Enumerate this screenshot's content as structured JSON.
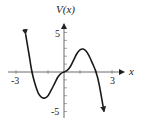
{
  "chart_data": {
    "type": "line",
    "title": "",
    "xlabel": "x",
    "ylabel": "V(x)",
    "xlim": [
      -3.5,
      4.5
    ],
    "ylim": [
      -5.5,
      6
    ],
    "x_ticks": [
      -3,
      -2,
      -1,
      0,
      1,
      2,
      3
    ],
    "x_tick_labels": {
      "-3": "-3",
      "3": "3"
    },
    "y_ticks": [
      -5,
      -4,
      -3,
      -2,
      -1,
      0,
      1,
      2,
      3,
      4,
      5
    ],
    "y_tick_labels": {
      "5": "5",
      "-5": "-5"
    },
    "grid": false,
    "legend": null,
    "series": [
      {
        "name": "V(x)",
        "description": "Polynomial with zeros at x=-2, x=0 (flat inflection), x=2; rises to +inf on left, falls to -inf on right",
        "x": [
          -2.4,
          -2.2,
          -2.0,
          -1.8,
          -1.6,
          -1.4,
          -1.2,
          -1.0,
          -0.8,
          -0.6,
          -0.4,
          -0.2,
          0.0,
          0.2,
          0.4,
          0.6,
          0.8,
          1.0,
          1.2,
          1.4,
          1.6,
          1.8,
          2.0,
          2.2,
          2.5
        ],
        "y": [
          4.8,
          2.4,
          0.0,
          -1.6,
          -2.7,
          -3.2,
          -3.3,
          -3.0,
          -2.3,
          -1.5,
          -0.7,
          -0.2,
          0.0,
          0.2,
          0.7,
          1.5,
          2.3,
          2.8,
          2.9,
          2.6,
          1.9,
          1.0,
          0.0,
          -1.6,
          -5.0
        ]
      }
    ],
    "annotations": [
      "arrow at left end (upward)",
      "arrow at right end (downward)",
      "arrow on positive y-axis",
      "arrow on positive x-axis"
    ]
  },
  "labels": {
    "y_axis_title": "V(x)",
    "x_axis_title": "x",
    "x_min_label": "-3",
    "x_max_label": "3",
    "y_max_label": "5",
    "y_min_label": "-5"
  }
}
